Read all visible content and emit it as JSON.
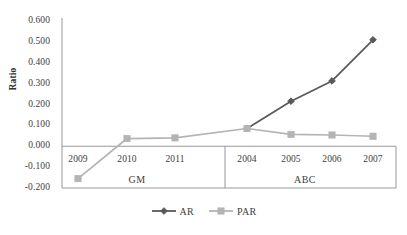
{
  "chart_data": {
    "type": "line",
    "title": "",
    "xlabel": "",
    "ylabel": "Ratio",
    "ylim": [
      -0.2,
      0.6
    ],
    "yticks": [
      "0.600",
      "0.500",
      "0.400",
      "0.300",
      "0.200",
      "0.100",
      "0.000",
      "-0.100",
      "-0.200"
    ],
    "ytick_values": [
      0.6,
      0.5,
      0.4,
      0.3,
      0.2,
      0.1,
      0.0,
      -0.1,
      -0.2
    ],
    "grid": false,
    "legend_position": "bottom",
    "groups": [
      {
        "name": "GM",
        "categories": [
          "2009",
          "2010",
          "2011"
        ]
      },
      {
        "name": "ABC",
        "categories": [
          "2004",
          "2005",
          "2006",
          "2007"
        ]
      }
    ],
    "categories": [
      "2009",
      "2010",
      "2011",
      "2004",
      "2005",
      "2006",
      "2007"
    ],
    "series": [
      {
        "name": "AR",
        "color": "#595959",
        "marker": "diamond",
        "values": [
          null,
          null,
          null,
          0.085,
          0.216,
          0.313,
          0.51
        ]
      },
      {
        "name": "PAR",
        "color": "#b4b4b4",
        "marker": "square",
        "values": [
          -0.155,
          0.037,
          0.04,
          0.085,
          0.057,
          0.054,
          0.048
        ]
      }
    ]
  },
  "legend": {
    "items": [
      {
        "label": "AR",
        "color": "#595959",
        "marker": "diamond"
      },
      {
        "label": "PAR",
        "color": "#b4b4b4",
        "marker": "square"
      }
    ]
  },
  "axis": {
    "y_title": "Ratio"
  },
  "colors": {
    "ar": "#595959",
    "par": "#b4b4b4",
    "axis": "#8c8c8c",
    "text": "#3d3d3d"
  }
}
